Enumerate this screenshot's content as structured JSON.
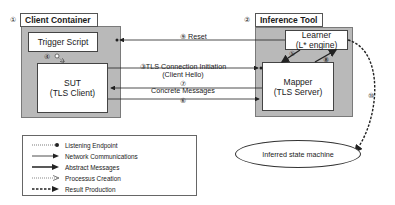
{
  "client_container": {
    "number": "①",
    "title": "Client Container",
    "trigger_script": "Trigger Script",
    "sut": {
      "line1": "SUT",
      "line2": "(TLS Client)"
    }
  },
  "inference_tool": {
    "number": "②",
    "title": "Inference Tool",
    "learner": {
      "line1": "Learner",
      "line2": "(L* engine)"
    },
    "mapper": {
      "line1": "Mapper",
      "line2": "(TLS Server)"
    }
  },
  "edges": {
    "reset": {
      "number": "⑨",
      "label": "Reset"
    },
    "tls_init": {
      "number": "③",
      "label_line1": "TLS Connection Initiation",
      "label_line2": "(Client Hello)"
    },
    "concrete_messages": {
      "number_top": "⑦",
      "number_bottom": "⑥",
      "label": "Concrete Messages"
    },
    "learner_to_mapper": {
      "number": "⑤"
    },
    "mapper_to_learner": {
      "number": "⑧"
    },
    "process_creation": {
      "number": "④"
    },
    "result": {
      "number": "⑩"
    }
  },
  "legend": {
    "items": [
      {
        "style": "dotted-dot",
        "label": "Listening Endpoint"
      },
      {
        "style": "solid-arrow",
        "label": "Network Communications"
      },
      {
        "style": "thick-arrow",
        "label": "Abstract Messages"
      },
      {
        "style": "dotted-open-arrow",
        "label": "Processus Creation"
      },
      {
        "style": "dashed-thick-arrow",
        "label": "Result Production"
      }
    ]
  },
  "output": {
    "label": "Inferred state machine"
  },
  "colors": {
    "container_fill": "#b9b9b9",
    "node_fill": "#ffffff",
    "line": "#222222"
  }
}
